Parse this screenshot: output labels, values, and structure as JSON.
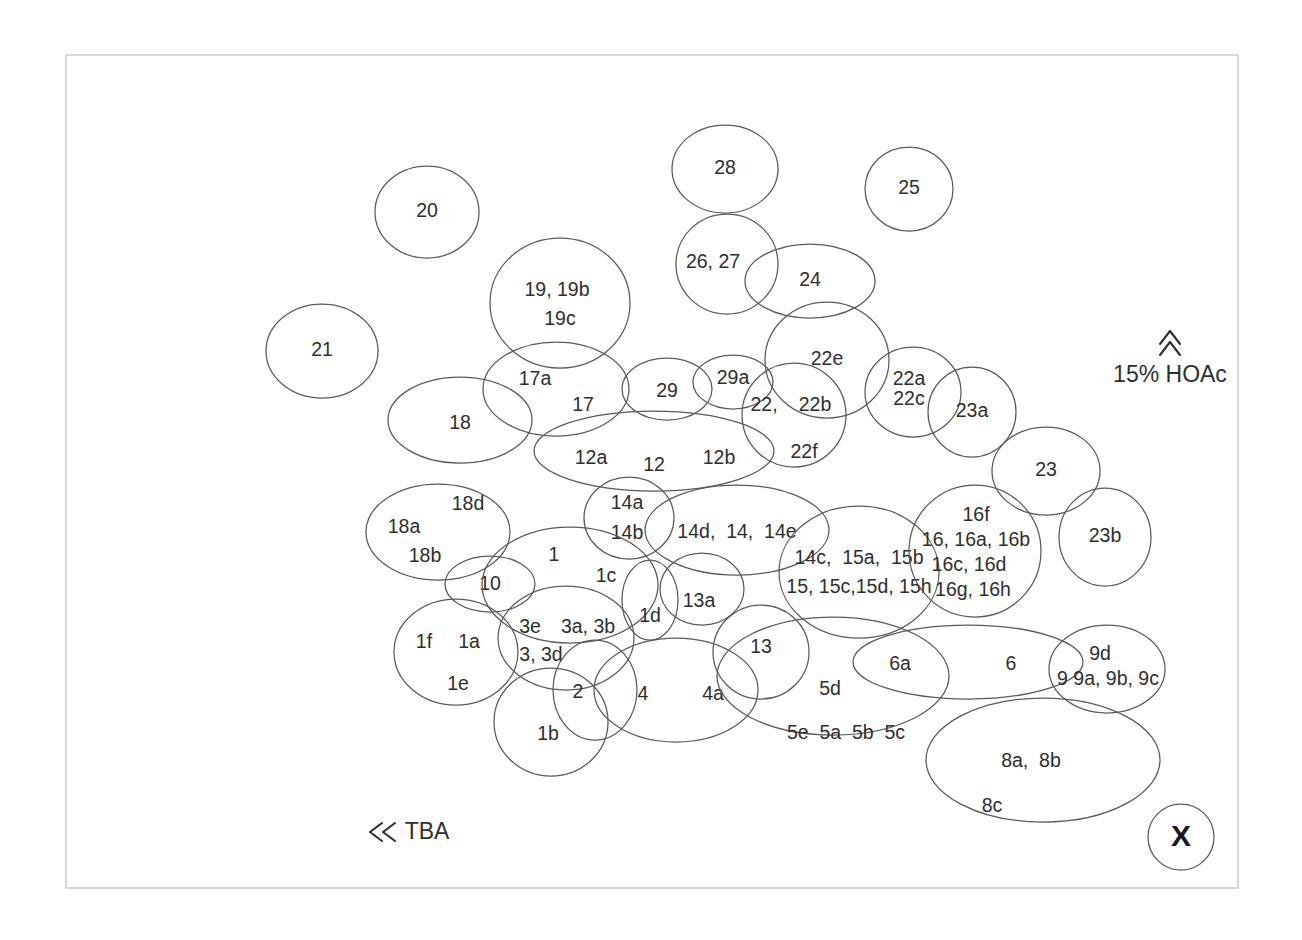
{
  "diagram": {
    "background_color": "#ffffff",
    "plate": {
      "name": "tlc-plate",
      "x": 66,
      "y": 55,
      "width": 1172,
      "height": 833,
      "fill": "#ffffff",
      "stroke": "#c9c9c9"
    },
    "style": {
      "spot_stroke": "#5a5a5a",
      "label_color": "#2e2e2e",
      "annotation_color": "#2e2e2e"
    }
  },
  "annotations": {
    "solvent_vertical": {
      "name": "vertical-solvent-annotation",
      "label": "15% HOAc",
      "arrow_glyph": "chevron-up",
      "x": 1170,
      "y": 376,
      "arrow_x": 1170,
      "arrow_y": 336
    },
    "solvent_horizontal": {
      "name": "horizontal-solvent-annotation",
      "label": "TBA",
      "arrow_glyph": "chevron-left",
      "text_x": 427,
      "text_y": 833,
      "arrow_x": 383,
      "arrow_y": 832
    },
    "origin": {
      "name": "origin-marker",
      "label": "X",
      "cx": 1181,
      "cy": 837,
      "r": 33
    }
  },
  "chart_data": {
    "type": "scatter",
    "xlabel": "TBA",
    "ylabel": "15% HOAc",
    "grid": false,
    "legend": "none",
    "spots": [
      {
        "id": "spot-20",
        "cx": 427,
        "cy": 212,
        "rx": 52,
        "ry": 46,
        "rot": 0,
        "labels": [
          {
            "text": "20",
            "dx": 0,
            "dy": 0
          }
        ]
      },
      {
        "id": "spot-21",
        "cx": 322,
        "cy": 351,
        "rx": 56,
        "ry": 47,
        "rot": 0,
        "labels": [
          {
            "text": "21",
            "dx": 0,
            "dy": 0
          }
        ]
      },
      {
        "id": "spot-28",
        "cx": 725,
        "cy": 169,
        "rx": 53,
        "ry": 44,
        "rot": 0,
        "labels": [
          {
            "text": "28",
            "dx": 0,
            "dy": 0
          }
        ]
      },
      {
        "id": "spot-25",
        "cx": 909,
        "cy": 189,
        "rx": 44,
        "ry": 42,
        "rot": 0,
        "labels": [
          {
            "text": "25",
            "dx": 0,
            "dy": 0
          }
        ]
      },
      {
        "id": "spot-26-27",
        "cx": 727,
        "cy": 264,
        "rx": 51,
        "ry": 50,
        "rot": 0,
        "labels": [
          {
            "text": "26, 27",
            "dx": -14,
            "dy": -1
          }
        ]
      },
      {
        "id": "spot-24",
        "cx": 810,
        "cy": 281,
        "rx": 65,
        "ry": 37,
        "rot": 0,
        "labels": [
          {
            "text": "24",
            "dx": 0,
            "dy": 0
          }
        ]
      },
      {
        "id": "spot-19",
        "cx": 560,
        "cy": 303,
        "rx": 70,
        "ry": 65,
        "rot": 0,
        "labels": [
          {
            "text": "19, 19b",
            "dx": -3,
            "dy": -12
          },
          {
            "text": "19c",
            "dx": 0,
            "dy": 17
          }
        ]
      },
      {
        "id": "spot-22e",
        "cx": 827,
        "cy": 360,
        "rx": 62,
        "ry": 58,
        "rot": 0,
        "labels": [
          {
            "text": "22e",
            "dx": 0,
            "dy": 0
          }
        ]
      },
      {
        "id": "spot-22a-22c",
        "cx": 913,
        "cy": 392,
        "rx": 48,
        "ry": 45,
        "rot": 0,
        "labels": [
          {
            "text": "22a",
            "dx": -4,
            "dy": -12
          },
          {
            "text": "22c",
            "dx": -4,
            "dy": 8
          }
        ]
      },
      {
        "id": "spot-23a",
        "cx": 972,
        "cy": 412,
        "rx": 44,
        "ry": 45,
        "rot": 0,
        "labels": [
          {
            "text": "23a",
            "dx": 0,
            "dy": 0
          }
        ]
      },
      {
        "id": "spot-17",
        "cx": 556,
        "cy": 389,
        "rx": 73,
        "ry": 47,
        "rot": 0,
        "labels": [
          {
            "text": "17a",
            "dx": -21,
            "dy": -9
          },
          {
            "text": "17",
            "dx": 27,
            "dy": 17
          }
        ]
      },
      {
        "id": "spot-18",
        "cx": 460,
        "cy": 420,
        "rx": 72,
        "ry": 43,
        "rot": 0,
        "labels": [
          {
            "text": "18",
            "dx": 0,
            "dy": 4
          }
        ]
      },
      {
        "id": "spot-29",
        "cx": 667,
        "cy": 389,
        "rx": 45,
        "ry": 31,
        "rot": 0,
        "labels": [
          {
            "text": "29",
            "dx": 0,
            "dy": 3
          }
        ]
      },
      {
        "id": "spot-29a",
        "cx": 733,
        "cy": 382,
        "rx": 40,
        "ry": 27,
        "rot": 0,
        "labels": [
          {
            "text": "29a",
            "dx": 0,
            "dy": -3
          }
        ]
      },
      {
        "id": "spot-22",
        "cx": 794,
        "cy": 415,
        "rx": 52,
        "ry": 52,
        "rot": 0,
        "labels": [
          {
            "text": "22,",
            "dx": -30,
            "dy": -9
          },
          {
            "text": "22b",
            "dx": 21,
            "dy": -9
          },
          {
            "text": "22f",
            "dx": 10,
            "dy": 38
          }
        ]
      },
      {
        "id": "spot-23",
        "cx": 1046,
        "cy": 471,
        "rx": 54,
        "ry": 44,
        "rot": 0,
        "labels": [
          {
            "text": "23",
            "dx": 0,
            "dy": 0
          }
        ]
      },
      {
        "id": "spot-23b",
        "cx": 1105,
        "cy": 537,
        "rx": 46,
        "ry": 49,
        "rot": 0,
        "labels": [
          {
            "text": "23b",
            "dx": 0,
            "dy": 0
          }
        ]
      },
      {
        "id": "spot-12",
        "cx": 654,
        "cy": 451,
        "rx": 120,
        "ry": 40,
        "rot": 0,
        "labels": [
          {
            "text": "12a",
            "dx": -63,
            "dy": 8
          },
          {
            "text": "12",
            "dx": 0,
            "dy": 15
          },
          {
            "text": "12b",
            "dx": 65,
            "dy": 8
          }
        ]
      },
      {
        "id": "spot-14a-14b",
        "cx": 629,
        "cy": 518,
        "rx": 45,
        "ry": 41,
        "rot": 0,
        "labels": [
          {
            "text": "14a",
            "dx": -2,
            "dy": -14
          },
          {
            "text": "14b",
            "dx": -2,
            "dy": 16
          }
        ]
      },
      {
        "id": "spot-14d-14-14e",
        "cx": 737,
        "cy": 530,
        "rx": 92,
        "ry": 45,
        "rot": 0,
        "labels": [
          {
            "text": "14d,  14,  14e",
            "dx": 0,
            "dy": 3
          }
        ]
      },
      {
        "id": "spot-18a-18b-18d",
        "cx": 438,
        "cy": 532,
        "rx": 72,
        "ry": 48,
        "rot": 0,
        "labels": [
          {
            "text": "18d",
            "dx": 30,
            "dy": -27
          },
          {
            "text": "18a",
            "dx": -34,
            "dy": -4
          },
          {
            "text": "18b",
            "dx": -13,
            "dy": 25
          }
        ]
      },
      {
        "id": "spot-10",
        "cx": 490,
        "cy": 584,
        "rx": 45,
        "ry": 28,
        "rot": 0,
        "labels": [
          {
            "text": "10",
            "dx": 0,
            "dy": 1
          }
        ]
      },
      {
        "id": "spot-14c-15",
        "cx": 859,
        "cy": 572,
        "rx": 80,
        "ry": 66,
        "rot": 0,
        "labels": [
          {
            "text": "14c,  15a,  15b",
            "dx": 0,
            "dy": -13
          },
          {
            "text": "15, 15c,15d, 15h",
            "dx": 0,
            "dy": 16
          }
        ]
      },
      {
        "id": "spot-16",
        "cx": 975,
        "cy": 551,
        "rx": 66,
        "ry": 66,
        "rot": 0,
        "labels": [
          {
            "text": "16f",
            "dx": 1,
            "dy": -35
          },
          {
            "text": "16, 16a, 16b",
            "dx": 1,
            "dy": -10
          },
          {
            "text": "16c, 16d",
            "dx": -6,
            "dy": 15
          },
          {
            "text": "16g, 16h",
            "dx": -2,
            "dy": 40
          }
        ]
      },
      {
        "id": "spot-1",
        "cx": 570,
        "cy": 585,
        "rx": 88,
        "ry": 58,
        "rot": 0,
        "labels": [
          {
            "text": "1",
            "dx": -16,
            "dy": -29
          },
          {
            "text": "1c",
            "dx": 36,
            "dy": -8
          }
        ]
      },
      {
        "id": "spot-1d",
        "cx": 650,
        "cy": 600,
        "rx": 28,
        "ry": 40,
        "rot": 0,
        "labels": [
          {
            "text": "1d",
            "dx": 0,
            "dy": 17
          }
        ]
      },
      {
        "id": "spot-13a",
        "cx": 702,
        "cy": 589,
        "rx": 42,
        "ry": 36,
        "rot": 0,
        "labels": [
          {
            "text": "13a",
            "dx": -3,
            "dy": 13
          }
        ]
      },
      {
        "id": "spot-3",
        "cx": 566,
        "cy": 638,
        "rx": 68,
        "ry": 52,
        "rot": 0,
        "labels": [
          {
            "text": "3e",
            "dx": -36,
            "dy": -10
          },
          {
            "text": "3a, 3b",
            "dx": 22,
            "dy": -10
          },
          {
            "text": "3, 3d",
            "dx": -25,
            "dy": 18
          }
        ]
      },
      {
        "id": "spot-1f-1a-1e",
        "cx": 456,
        "cy": 652,
        "rx": 62,
        "ry": 53,
        "rot": 0,
        "labels": [
          {
            "text": "1f",
            "dx": -32,
            "dy": -9
          },
          {
            "text": "1a",
            "dx": 13,
            "dy": -9
          },
          {
            "text": "1e",
            "dx": 2,
            "dy": 33
          }
        ]
      },
      {
        "id": "spot-13",
        "cx": 761,
        "cy": 652,
        "rx": 48,
        "ry": 47,
        "rot": 0,
        "labels": [
          {
            "text": "13",
            "dx": 0,
            "dy": -4
          }
        ]
      },
      {
        "id": "spot-6",
        "cx": 968,
        "cy": 662,
        "rx": 115,
        "ry": 37,
        "rot": 0,
        "labels": [
          {
            "text": "6a",
            "dx": -68,
            "dy": 3
          },
          {
            "text": "6",
            "dx": 43,
            "dy": 3
          }
        ]
      },
      {
        "id": "spot-9",
        "cx": 1107,
        "cy": 669,
        "rx": 58,
        "ry": 44,
        "rot": 0,
        "labels": [
          {
            "text": "9d",
            "dx": -7,
            "dy": -14
          },
          {
            "text": "9 9a, 9b, 9c",
            "dx": 1,
            "dy": 11
          }
        ]
      },
      {
        "id": "spot-2",
        "cx": 595,
        "cy": 690,
        "rx": 42,
        "ry": 50,
        "rot": 0,
        "labels": [
          {
            "text": "2",
            "dx": -17,
            "dy": 3
          }
        ]
      },
      {
        "id": "spot-4",
        "cx": 676,
        "cy": 690,
        "rx": 82,
        "ry": 52,
        "rot": 0,
        "labels": [
          {
            "text": "4",
            "dx": -33,
            "dy": 5
          },
          {
            "text": "4a",
            "dx": 37,
            "dy": 5
          }
        ]
      },
      {
        "id": "spot-1b",
        "cx": 551,
        "cy": 722,
        "rx": 57,
        "ry": 54,
        "rot": 0,
        "labels": [
          {
            "text": "1b",
            "dx": -3,
            "dy": 13
          }
        ]
      },
      {
        "id": "spot-5",
        "cx": 833,
        "cy": 676,
        "rx": 116,
        "ry": 59,
        "rot": 0,
        "labels": [
          {
            "text": "5d",
            "dx": -3,
            "dy": 14
          },
          {
            "text": "5e  5a  5b  5c",
            "dx": 13,
            "dy": 58
          }
        ]
      },
      {
        "id": "spot-8",
        "cx": 1043,
        "cy": 760,
        "rx": 117,
        "ry": 62,
        "rot": 0,
        "labels": [
          {
            "text": "8a,  8b",
            "dx": -12,
            "dy": 2
          },
          {
            "text": "8c",
            "dx": -51,
            "dy": 47
          }
        ]
      }
    ]
  }
}
